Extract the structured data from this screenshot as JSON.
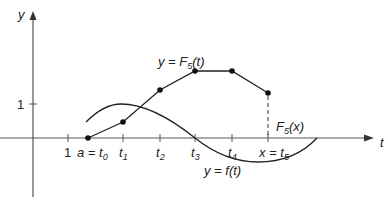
{
  "figure": {
    "axes": {
      "x_label": "t",
      "y_label": "y",
      "y_tick_label": "1",
      "x_tick_label_one": "1"
    },
    "ticks": [
      {
        "label": "a = t",
        "sub": "0"
      },
      {
        "label": "t",
        "sub": "1"
      },
      {
        "label": "t",
        "sub": "2"
      },
      {
        "label": "t",
        "sub": "3"
      },
      {
        "label": "t",
        "sub": "4"
      },
      {
        "label": "x = t",
        "sub": "5"
      }
    ],
    "curves": {
      "polyline_label": "y = F",
      "polyline_label_sub": "5",
      "polyline_label_suffix": "(t)",
      "smooth_label": "y = f(t)",
      "value_label": "F",
      "value_label_sub": "5",
      "value_label_suffix": "(x)"
    },
    "colors": {
      "line": "#222222",
      "axis": "#555555",
      "background": "#ffffff"
    }
  }
}
